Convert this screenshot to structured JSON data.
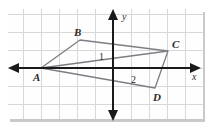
{
  "figure": {
    "type": "coordinate-plane-geometry-diagram",
    "background_color": "#ffffff",
    "plot_background_color": "#fefefe",
    "grid_color": "#d8d8dc",
    "axis_color": "#1a1a1a",
    "shape_color": "#7d7d84",
    "label_color": "#2b2b2b",
    "shadow_color": "#c9c9c9",
    "axes": {
      "x_label": "x",
      "y_label": "y",
      "x_axis_name": "horizontal-axis",
      "y_axis_name": "vertical-axis",
      "arrowheads": [
        "left",
        "right",
        "up",
        "down"
      ]
    },
    "grid": {
      "visible": true,
      "cell_size_px": 18,
      "columns": 11,
      "rows": 6
    },
    "shape": {
      "name": "quadrilateral ABCD",
      "vertex_labels": [
        "A",
        "B",
        "C",
        "D"
      ],
      "vertices": [
        {
          "label": "A",
          "x_px": 41,
          "y_px": 68
        },
        {
          "label": "B",
          "x_px": 80,
          "y_px": 40
        },
        {
          "label": "C",
          "x_px": 168,
          "y_px": 51
        },
        {
          "label": "D",
          "x_px": 155,
          "y_px": 88
        }
      ],
      "diagonal": "A to C",
      "diagonal_name": "diagonal-AC"
    },
    "angle_labels": [
      {
        "text": "1",
        "x_px": 101,
        "y_px": 56
      },
      {
        "text": "2",
        "x_px": 133,
        "y_px": 79
      }
    ]
  }
}
